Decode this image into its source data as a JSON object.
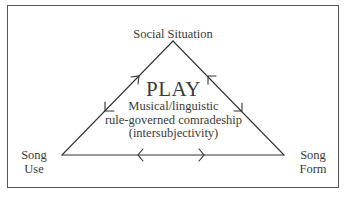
{
  "diagram": {
    "type": "triangle-relationship",
    "nodes": {
      "top": "Social Situation",
      "left": [
        "Song",
        "Use"
      ],
      "right": [
        "Song",
        "Form"
      ]
    },
    "center": {
      "title": "PLAY",
      "lines": [
        "Musical/linguistic",
        "rule-governed comradeship",
        "(intersubjectivity)"
      ]
    },
    "edges": [
      {
        "from": "Song Use",
        "to": "Social Situation",
        "direction": "bidirectional"
      },
      {
        "from": "Social Situation",
        "to": "Song Form",
        "direction": "bidirectional"
      },
      {
        "from": "Song Use",
        "to": "Song Form",
        "direction": "bidirectional"
      }
    ]
  }
}
